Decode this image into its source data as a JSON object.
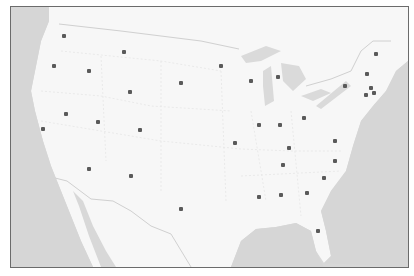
{
  "map": {
    "region": "Contiguous United States",
    "colors": {
      "land": "#f7f7f7",
      "water": "#d6d6d6",
      "border": "#6b6b6b",
      "marker": "#5a5a5a",
      "state_lines": "#e2e2e2"
    },
    "markers": [
      {
        "x": 63,
        "y": 35
      },
      {
        "x": 123,
        "y": 51
      },
      {
        "x": 53,
        "y": 65
      },
      {
        "x": 88,
        "y": 70
      },
      {
        "x": 180,
        "y": 82
      },
      {
        "x": 220,
        "y": 65
      },
      {
        "x": 250,
        "y": 80
      },
      {
        "x": 277,
        "y": 76
      },
      {
        "x": 129,
        "y": 91
      },
      {
        "x": 65,
        "y": 113
      },
      {
        "x": 97,
        "y": 121
      },
      {
        "x": 139,
        "y": 129
      },
      {
        "x": 42,
        "y": 128
      },
      {
        "x": 88,
        "y": 168
      },
      {
        "x": 130,
        "y": 175
      },
      {
        "x": 180,
        "y": 208
      },
      {
        "x": 234,
        "y": 142
      },
      {
        "x": 258,
        "y": 124
      },
      {
        "x": 279,
        "y": 124
      },
      {
        "x": 303,
        "y": 117
      },
      {
        "x": 334,
        "y": 140
      },
      {
        "x": 288,
        "y": 147
      },
      {
        "x": 282,
        "y": 164
      },
      {
        "x": 334,
        "y": 160
      },
      {
        "x": 323,
        "y": 177
      },
      {
        "x": 306,
        "y": 192
      },
      {
        "x": 280,
        "y": 194
      },
      {
        "x": 258,
        "y": 196
      },
      {
        "x": 317,
        "y": 230
      },
      {
        "x": 375,
        "y": 53
      },
      {
        "x": 366,
        "y": 73
      },
      {
        "x": 344,
        "y": 85
      },
      {
        "x": 370,
        "y": 87
      },
      {
        "x": 373,
        "y": 92
      },
      {
        "x": 365,
        "y": 94
      }
    ]
  }
}
